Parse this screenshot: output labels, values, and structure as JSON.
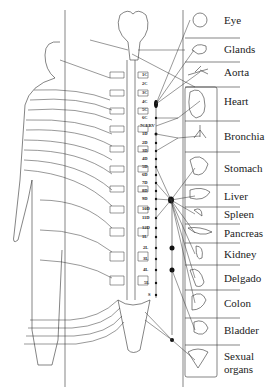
{
  "diagram": {
    "type": "autonomic nervous system / spinal innervation chart",
    "organs": [
      {
        "label": "Eye",
        "y": 20
      },
      {
        "label": "Glands",
        "y": 49
      },
      {
        "label": "Aorta",
        "y": 72
      },
      {
        "label": "Heart",
        "y": 101
      },
      {
        "label": "Bronchia",
        "y": 136
      },
      {
        "label": "Stomach",
        "y": 168
      },
      {
        "label": "Liver",
        "y": 196
      },
      {
        "label": "Spleen",
        "y": 214
      },
      {
        "label": "Pancreas",
        "y": 233
      },
      {
        "label": "Kidney",
        "y": 254
      },
      {
        "label": "Delgado",
        "y": 278
      },
      {
        "label": "Colon",
        "y": 303
      },
      {
        "label": "Bladder",
        "y": 330
      },
      {
        "label": "Sexual",
        "y": 356
      },
      {
        "label": "organs",
        "y": 369
      }
    ],
    "vertebrae": [
      {
        "label": "1C",
        "y": 75
      },
      {
        "label": "2C",
        "y": 84
      },
      {
        "label": "3C",
        "y": 93
      },
      {
        "label": "4C",
        "y": 102
      },
      {
        "label": "5C",
        "y": 110
      },
      {
        "label": "6C",
        "y": 118
      },
      {
        "label": "7CERV",
        "y": 126
      },
      {
        "label": "1D",
        "y": 134
      },
      {
        "label": "2D",
        "y": 143
      },
      {
        "label": "3D",
        "y": 151
      },
      {
        "label": "4D",
        "y": 159
      },
      {
        "label": "5D",
        "y": 167
      },
      {
        "label": "6D",
        "y": 175
      },
      {
        "label": "7D",
        "y": 183
      },
      {
        "label": "8D",
        "y": 191
      },
      {
        "label": "9D",
        "y": 199
      },
      {
        "label": "10D",
        "y": 209
      },
      {
        "label": "11D",
        "y": 218
      },
      {
        "label": "12D",
        "y": 228
      },
      {
        "label": "1L",
        "y": 237
      },
      {
        "label": "2L",
        "y": 248
      },
      {
        "label": "3L",
        "y": 259
      },
      {
        "label": "4L",
        "y": 270
      },
      {
        "label": "5L",
        "y": 283
      },
      {
        "label": "S",
        "y": 295
      }
    ]
  }
}
